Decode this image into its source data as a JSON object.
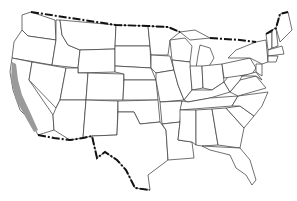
{
  "map": {
    "type": "outline-map",
    "region": "United States (contiguous)",
    "highlighted_region": "California coastal strip",
    "colors": {
      "background": "#ffffff",
      "state_stroke": "#333333",
      "international_border": "#111111",
      "highlight_fill": "#9a9a9a"
    },
    "labels": []
  }
}
